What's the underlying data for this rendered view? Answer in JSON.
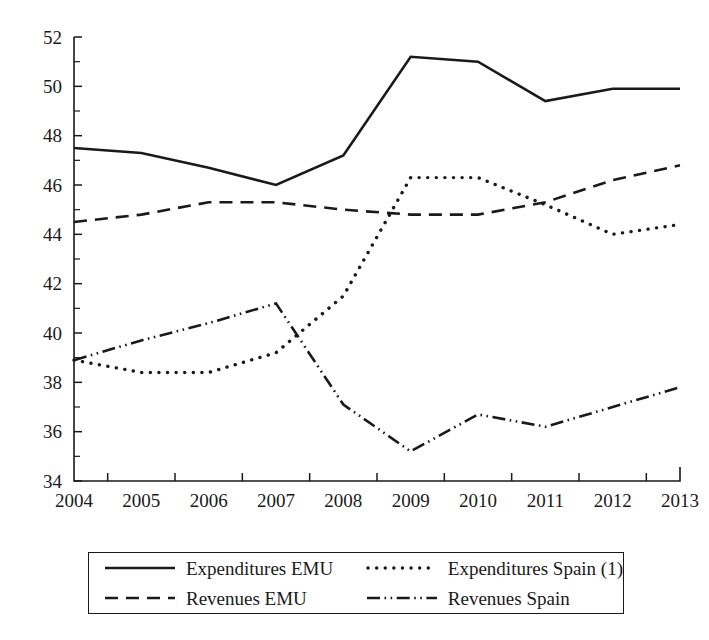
{
  "chart_data": {
    "type": "line",
    "title": "",
    "xlabel": "",
    "ylabel": "",
    "x": [
      2004,
      2005,
      2006,
      2007,
      2008,
      2009,
      2010,
      2011,
      2012,
      2013
    ],
    "categories": [
      "2004",
      "2005",
      "2006",
      "2007",
      "2008",
      "2009",
      "2010",
      "2011",
      "2012",
      "2013"
    ],
    "xlim": [
      2004,
      2013
    ],
    "ylim": [
      34,
      52
    ],
    "ytick_step": 2,
    "yticks": [
      34,
      36,
      38,
      40,
      42,
      44,
      46,
      48,
      50,
      52
    ],
    "ytick_labels": [
      "34",
      "36",
      "38",
      "40",
      "42",
      "44",
      "46",
      "48",
      "50",
      "52"
    ],
    "minor_ticks": true,
    "grid": false,
    "legend_position": "bottom",
    "series": [
      {
        "name": "Expenditures EMU",
        "style": "solid",
        "values": [
          47.5,
          47.3,
          46.7,
          46.0,
          47.2,
          51.2,
          51.0,
          49.4,
          49.9,
          49.9
        ]
      },
      {
        "name": "Expenditures Spain (1)",
        "style": "dotted",
        "values": [
          38.9,
          38.4,
          38.4,
          39.2,
          41.5,
          46.3,
          46.3,
          45.2,
          44.0,
          44.4
        ]
      },
      {
        "name": "Revenues EMU",
        "style": "dashed",
        "values": [
          44.5,
          44.8,
          45.3,
          45.3,
          45.0,
          44.8,
          44.8,
          45.3,
          46.2,
          46.8
        ]
      },
      {
        "name": "Revenues Spain",
        "style": "dash-dot-dot",
        "values": [
          38.9,
          39.7,
          40.4,
          41.2,
          37.1,
          35.2,
          36.7,
          36.2,
          37.0,
          37.8
        ]
      }
    ]
  },
  "legend": {
    "entries": [
      {
        "label": "Expenditures EMU",
        "style": "solid"
      },
      {
        "label": "Expenditures Spain (1)",
        "style": "dotted"
      },
      {
        "label": "Revenues EMU",
        "style": "dashed"
      },
      {
        "label": "Revenues Spain",
        "style": "dash-dot-dot"
      }
    ]
  },
  "colors": {
    "ink": "#1a1a1a",
    "background": "#ffffff"
  }
}
